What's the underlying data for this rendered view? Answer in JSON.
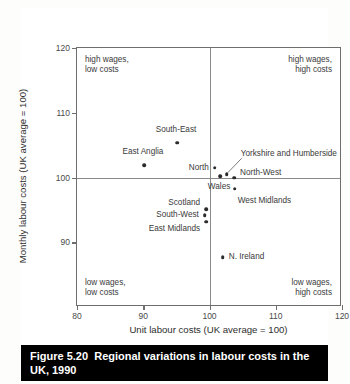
{
  "figure": {
    "number": "Figure 5.20",
    "caption": "Regional variations in labour costs in the UK, 1990"
  },
  "chart_data": {
    "type": "scatter",
    "title": "Regional variations in labour costs in the UK, 1990",
    "xlabel": "Unit labour costs (UK average = 100)",
    "ylabel": "Monthly labour costs (UK average = 100)",
    "xlim": [
      80,
      120
    ],
    "ylim": [
      80,
      120
    ],
    "xticks": [
      80,
      90,
      100,
      110,
      120
    ],
    "yticks": [
      90,
      100,
      110,
      120
    ],
    "grid": false,
    "reference_lines": {
      "x": 100,
      "y": 100
    },
    "legend": "none",
    "points": [
      {
        "label": "South-East",
        "x": 95.1,
        "y": 105.4,
        "label_dx": -1,
        "label_dy": -13,
        "label_align": "center"
      },
      {
        "label": "East Anglia",
        "x": 90.1,
        "y": 101.9,
        "label_dx": -1,
        "label_dy": -13,
        "label_align": "center"
      },
      {
        "label": "North",
        "x": 100.8,
        "y": 101.5,
        "label_dx": -6,
        "label_dy": 0,
        "label_align": "right"
      },
      {
        "label": "Yorkshire and Humberside",
        "x": 102.6,
        "y": 100.5,
        "label_dx": 14,
        "label_dy": -20,
        "label_align": "left"
      },
      {
        "label": "North-West",
        "x": 103.7,
        "y": 100.0,
        "label_dx": 6,
        "label_dy": -5,
        "label_align": "left"
      },
      {
        "label": "Wales",
        "x": 101.6,
        "y": 100.2,
        "label_dx": -1,
        "label_dy": 11,
        "label_align": "center"
      },
      {
        "label": "West Midlands",
        "x": 103.8,
        "y": 98.3,
        "label_dx": 3,
        "label_dy": 12,
        "label_align": "left"
      },
      {
        "label": "Scotland",
        "x": 99.5,
        "y": 95.1,
        "label_dx": -6,
        "label_dy": -6,
        "label_align": "right"
      },
      {
        "label": "South-West",
        "x": 99.3,
        "y": 94.2,
        "label_dx": -6,
        "label_dy": 0,
        "label_align": "right"
      },
      {
        "label": "East Midlands",
        "x": 99.5,
        "y": 93.2,
        "label_dx": -6,
        "label_dy": 7,
        "label_align": "right"
      },
      {
        "label": "N. Ireland",
        "x": 102.0,
        "y": 87.7,
        "label_dx": 6,
        "label_dy": 0,
        "label_align": "left"
      }
    ],
    "annotations": {
      "top_left": "high wages,\nlow costs",
      "top_right": "high wages,\nhigh costs",
      "bottom_left": "low wages,\nlow costs",
      "bottom_right": "low wages,\nhigh costs"
    }
  },
  "colors": {
    "point": "#2b2b2b",
    "axis": "#6e6e6e",
    "reference_line": "#8a8a8a",
    "caption_bg": "#000000",
    "caption_fg": "#ffffff"
  }
}
